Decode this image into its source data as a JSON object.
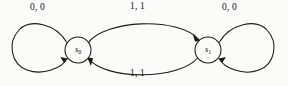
{
  "diagram": {
    "type": "finite-state-machine",
    "background_color": "#fbfbf9",
    "stroke_color": "#1a1a1a",
    "states": [
      {
        "id": "s0",
        "label_base": "s",
        "label_sub": "0",
        "cx": 78,
        "cy": 50,
        "r": 13
      },
      {
        "id": "s1",
        "label_base": "s",
        "label_sub": "1",
        "cx": 208,
        "cy": 50,
        "r": 13
      }
    ],
    "transitions": [
      {
        "id": "loop-left",
        "from": "s0",
        "to": "s0",
        "label": "0, 0",
        "input": "0",
        "output": "0",
        "shape": "self-loop-left"
      },
      {
        "id": "top-arc",
        "from": "s0",
        "to": "s1",
        "label": "1, 1",
        "input": "1",
        "output": "1",
        "shape": "arc-over"
      },
      {
        "id": "bottom-arc",
        "from": "s1",
        "to": "s0",
        "label": "1, 1",
        "input": "1",
        "output": "1",
        "shape": "arc-under"
      },
      {
        "id": "loop-right",
        "from": "s1",
        "to": "s1",
        "label": "0, 0",
        "input": "0",
        "output": "0",
        "shape": "self-loop-right"
      }
    ]
  }
}
